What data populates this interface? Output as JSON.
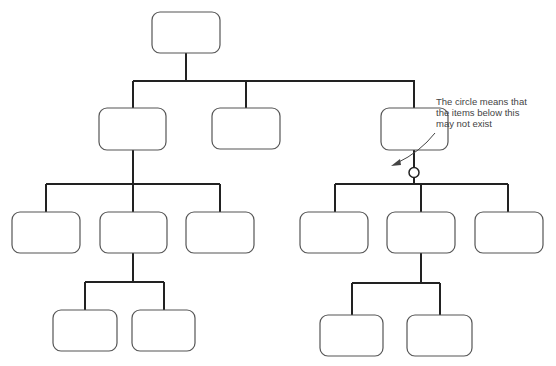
{
  "diagram": {
    "type": "hierarchy-tree",
    "annotation": {
      "lines": [
        "The circle means that",
        "the items below this",
        "may not exist"
      ]
    },
    "nodes": [
      {
        "id": "root",
        "label": ""
      },
      {
        "id": "l1-left",
        "label": "",
        "parent": "root"
      },
      {
        "id": "l1-middle",
        "label": "",
        "parent": "root"
      },
      {
        "id": "l1-right",
        "label": "",
        "parent": "root"
      },
      {
        "id": "l2-left-1",
        "label": "",
        "parent": "l1-left"
      },
      {
        "id": "l2-left-2",
        "label": "",
        "parent": "l1-left"
      },
      {
        "id": "l2-left-3",
        "label": "",
        "parent": "l1-left"
      },
      {
        "id": "l2-right-1",
        "label": "",
        "parent": "l1-right",
        "optional": true
      },
      {
        "id": "l2-right-2",
        "label": "",
        "parent": "l1-right",
        "optional": true
      },
      {
        "id": "l2-right-3",
        "label": "",
        "parent": "l1-right",
        "optional": true
      },
      {
        "id": "l3-left-1",
        "label": "",
        "parent": "l2-left-2"
      },
      {
        "id": "l3-left-2",
        "label": "",
        "parent": "l2-left-2"
      },
      {
        "id": "l3-right-1",
        "label": "",
        "parent": "l2-right-2"
      },
      {
        "id": "l3-right-2",
        "label": "",
        "parent": "l2-right-2"
      }
    ],
    "colors": {
      "line": "#222222",
      "box_stroke": "#555555",
      "text": "#444444"
    }
  }
}
